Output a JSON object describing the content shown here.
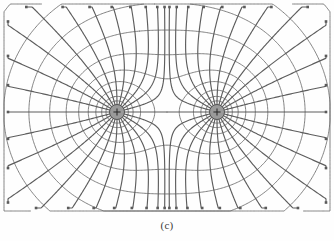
{
  "figure": {
    "caption": "(c)",
    "background_color": "#fefefe",
    "line_color": "#5d5d5d",
    "equipotential_color": "#6a6a6a",
    "charge_fill_color": "#9a9a9a",
    "charge_stroke_color": "#4a4a4a",
    "marker_color": "#5a5a5a",
    "width": 334,
    "height": 241
  },
  "chart_data": {
    "type": "scatter",
    "xlabel": "",
    "ylabel": "",
    "xlim": [
      0,
      334
    ],
    "ylim": [
      0,
      241
    ],
    "grid": false,
    "legend": null,
    "charges": [
      {
        "label": "+",
        "sign": "positive",
        "x": 117,
        "y": 112,
        "radius": 7.5,
        "magnitude": 1
      },
      {
        "label": "+",
        "sign": "positive",
        "x": 217,
        "y": 112,
        "radius": 7.5,
        "magnitude": 1
      }
    ],
    "saddle_point": {
      "x": 167,
      "y": 112
    },
    "field_lines_per_charge": 24,
    "equipotential_levels": 11,
    "arrow_marker": "square-dot",
    "arrow_direction": "outward",
    "annotations": [
      {
        "text": "(c)",
        "x": 167,
        "y": 229
      }
    ]
  }
}
